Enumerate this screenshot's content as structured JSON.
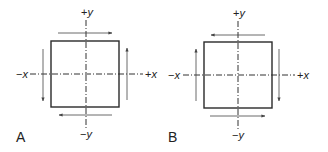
{
  "diagram": {
    "colors": {
      "stroke": "#2a2a2a",
      "axis": "#333333",
      "arrow": "#444444",
      "text": "#222222"
    },
    "panels": [
      {
        "id": "A",
        "label": "A",
        "axes": {
          "pos_y": "+y",
          "neg_y": "−y",
          "pos_x": "+x",
          "neg_x": "−x"
        },
        "arrows": {
          "top": "right",
          "bottom": "left",
          "left": "down",
          "right": "up"
        }
      },
      {
        "id": "B",
        "label": "B",
        "axes": {
          "pos_y": "+y",
          "neg_y": "−y",
          "pos_x": "+x",
          "neg_x": "−x"
        },
        "arrows": {
          "top": "left",
          "bottom": "right",
          "left": "up",
          "right": "down"
        }
      }
    ]
  }
}
